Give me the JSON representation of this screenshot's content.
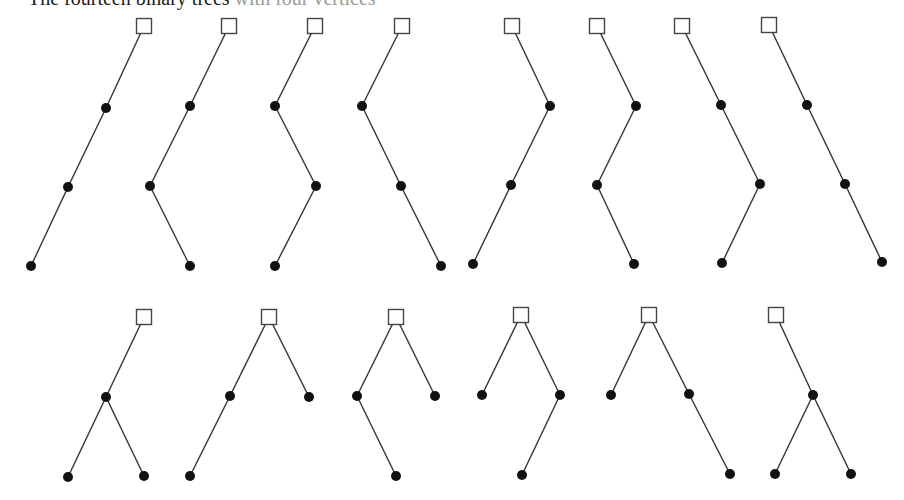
{
  "heading": {
    "dark": "The fourteen binary trees",
    "light": " with four vertices"
  },
  "style": {
    "edge_color": "#333333",
    "node_color": "#111111",
    "root_stroke": "#444444",
    "root_fill": "#ffffff",
    "node_radius": 5,
    "root_size": 15
  },
  "trees": [
    {
      "id": 1,
      "root": [
        144,
        26
      ],
      "nodes": [
        [
          106,
          108
        ],
        [
          68,
          187
        ],
        [
          31,
          266
        ]
      ],
      "edges": [
        [
          0,
          1
        ],
        [
          1,
          2
        ],
        [
          2,
          3
        ]
      ]
    },
    {
      "id": 2,
      "root": [
        229,
        26
      ],
      "nodes": [
        [
          190,
          106
        ],
        [
          150,
          186
        ],
        [
          190,
          266
        ]
      ],
      "edges": [
        [
          0,
          1
        ],
        [
          1,
          2
        ],
        [
          2,
          3
        ]
      ]
    },
    {
      "id": 3,
      "root": [
        315,
        26
      ],
      "nodes": [
        [
          275,
          106
        ],
        [
          316,
          186
        ],
        [
          275,
          266
        ]
      ],
      "edges": [
        [
          0,
          1
        ],
        [
          1,
          2
        ],
        [
          2,
          3
        ]
      ]
    },
    {
      "id": 4,
      "root": [
        402,
        26
      ],
      "nodes": [
        [
          362,
          106
        ],
        [
          401,
          186
        ],
        [
          441,
          266
        ]
      ],
      "edges": [
        [
          0,
          1
        ],
        [
          1,
          2
        ],
        [
          2,
          3
        ]
      ]
    },
    {
      "id": 5,
      "root": [
        512,
        26
      ],
      "nodes": [
        [
          550,
          106
        ],
        [
          511,
          185
        ],
        [
          473,
          264
        ]
      ],
      "edges": [
        [
          0,
          1
        ],
        [
          1,
          2
        ],
        [
          2,
          3
        ]
      ]
    },
    {
      "id": 6,
      "root": [
        597,
        26
      ],
      "nodes": [
        [
          636,
          106
        ],
        [
          597,
          185
        ],
        [
          634,
          264
        ]
      ],
      "edges": [
        [
          0,
          1
        ],
        [
          1,
          2
        ],
        [
          2,
          3
        ]
      ]
    },
    {
      "id": 7,
      "root": [
        682,
        26
      ],
      "nodes": [
        [
          721,
          105
        ],
        [
          760,
          184
        ],
        [
          722,
          263
        ]
      ],
      "edges": [
        [
          0,
          1
        ],
        [
          1,
          2
        ],
        [
          2,
          3
        ]
      ]
    },
    {
      "id": 8,
      "root": [
        769,
        25
      ],
      "nodes": [
        [
          807,
          105
        ],
        [
          845,
          184
        ],
        [
          882,
          262
        ]
      ],
      "edges": [
        [
          0,
          1
        ],
        [
          1,
          2
        ],
        [
          2,
          3
        ]
      ]
    },
    {
      "id": 9,
      "root": [
        144,
        317
      ],
      "nodes": [
        [
          106,
          397
        ],
        [
          68,
          477
        ],
        [
          144,
          476
        ]
      ],
      "edges": [
        [
          0,
          1
        ],
        [
          1,
          2
        ],
        [
          1,
          3
        ]
      ]
    },
    {
      "id": 10,
      "root": [
        269,
        317
      ],
      "nodes": [
        [
          230,
          396
        ],
        [
          190,
          476
        ],
        [
          309,
          397
        ]
      ],
      "edges": [
        [
          0,
          1
        ],
        [
          1,
          2
        ],
        [
          0,
          3
        ]
      ]
    },
    {
      "id": 11,
      "root": [
        396,
        317
      ],
      "nodes": [
        [
          357,
          396
        ],
        [
          396,
          476
        ],
        [
          435,
          396
        ]
      ],
      "edges": [
        [
          0,
          1
        ],
        [
          1,
          2
        ],
        [
          0,
          3
        ]
      ]
    },
    {
      "id": 12,
      "root": [
        521,
        315
      ],
      "nodes": [
        [
          482,
          395
        ],
        [
          560,
          395
        ],
        [
          522,
          475
        ]
      ],
      "edges": [
        [
          0,
          1
        ],
        [
          0,
          2
        ],
        [
          2,
          3
        ]
      ]
    },
    {
      "id": 13,
      "root": [
        649,
        315
      ],
      "nodes": [
        [
          611,
          395
        ],
        [
          689,
          394
        ],
        [
          730,
          474
        ]
      ],
      "edges": [
        [
          0,
          1
        ],
        [
          0,
          2
        ],
        [
          2,
          3
        ]
      ]
    },
    {
      "id": 14,
      "root": [
        776,
        315
      ],
      "nodes": [
        [
          813,
          395
        ],
        [
          775,
          474
        ],
        [
          851,
          474
        ]
      ],
      "edges": [
        [
          0,
          1
        ],
        [
          1,
          2
        ],
        [
          1,
          3
        ]
      ]
    }
  ]
}
